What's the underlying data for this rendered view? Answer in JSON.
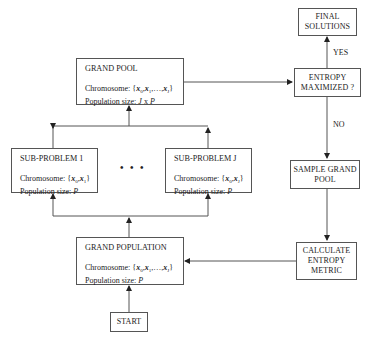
{
  "diagram": {
    "nodes": {
      "grand_pool": {
        "title": "GRAND POOL",
        "chromosome_label": "Chromosome: ",
        "chromosome_value": "{x0, x1, ..., xJ}",
        "population_label": "Population size: ",
        "population_value": "J x P"
      },
      "sub_problem_1": {
        "title": "SUB-PROBLEM 1",
        "chromosome_label": "Chromosome: ",
        "chromosome_value": "{x0, x1}",
        "population_label": "Population size: ",
        "population_value": "P"
      },
      "sub_problem_j": {
        "title": "SUB-PROBLEM J",
        "chromosome_label": "Chromosome: ",
        "chromosome_value": "{x0, xJ}",
        "population_label": "Population size: ",
        "population_value": "P"
      },
      "ellipsis": "• • •",
      "grand_population": {
        "title": "GRAND POPULATION",
        "chromosome_label": "Chromosome: ",
        "chromosome_value": "{x0, x1, ..., xJ}",
        "population_label": "Population size: ",
        "population_value": "P"
      },
      "start": "START",
      "final_solutions": {
        "line1": "FINAL",
        "line2": "SOLUTIONS"
      },
      "entropy_maximized": {
        "line1": "ENTROPY",
        "line2": "MAXIMIZED ?"
      },
      "sample_grand_pool": {
        "line1": "SAMPLE GRAND",
        "line2": "POOL"
      },
      "calculate_entropy": {
        "line1": "CALCULATE",
        "line2": "ENTROPY",
        "line3": "METRIC"
      }
    },
    "edge_labels": {
      "yes": "YES",
      "no": "NO"
    },
    "colors": {
      "line": "#444444",
      "border": "#555555",
      "background": "#ffffff"
    }
  }
}
